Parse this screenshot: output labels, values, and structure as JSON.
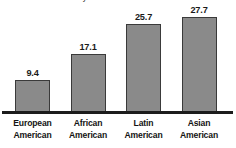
{
  "chart_data": {
    "type": "bar",
    "title": "a different racial identity",
    "title_clipped": true,
    "xlabel": "",
    "ylabel": "",
    "ylim": [
      0,
      31
    ],
    "grid": false,
    "legend": "none",
    "orientation": "vertical",
    "bar_color": "#8a8a8a",
    "bar_border_color": "#3a3a3a",
    "axis_color": "#1c1c1c",
    "label_color": "#141414",
    "categories": [
      "European American",
      "African American",
      "Latin American",
      "Asian American"
    ],
    "category_lines": [
      [
        "European",
        "American"
      ],
      [
        "African",
        "American"
      ],
      [
        "Latin",
        "American"
      ],
      [
        "Asian",
        "American"
      ]
    ],
    "values": [
      9.4,
      17.1,
      25.7,
      27.7
    ],
    "value_labels": [
      "9.4",
      "17.1",
      "25.7",
      "27.7"
    ]
  }
}
